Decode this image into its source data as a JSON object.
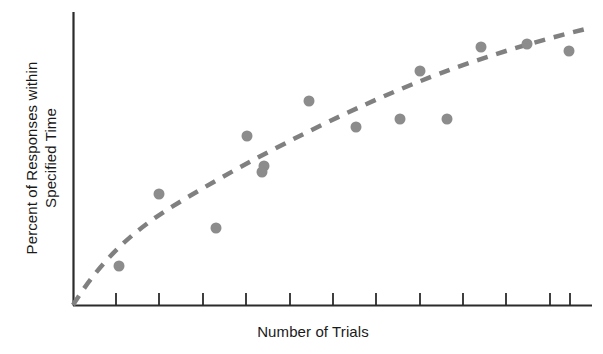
{
  "figure": {
    "background_color": "#ffffff",
    "axis_color": "#2b2b2b",
    "marker_color": "#8c8c8c",
    "trend_color": "#808080"
  },
  "axes": {
    "y_title_line1": "Percent of Responses within",
    "y_title_line2": "Specified Time",
    "x_title": "Number of Trials",
    "tick_count": 12
  },
  "chart_data": {
    "type": "scatter",
    "title": "",
    "subtitle": "",
    "xlabel": "Number of Trials",
    "ylabel": "Percent of Responses within Specified Time",
    "grid": false,
    "legend": "none",
    "xlim": [
      0,
      12
    ],
    "ylim": [
      0,
      100
    ],
    "x_tick_labels": [],
    "y_tick_labels": [],
    "x_tick_values": [
      1,
      2,
      3,
      4,
      5,
      6,
      7,
      8,
      9,
      10,
      11,
      12
    ],
    "annotations": [],
    "series": [
      {
        "name": "Observed responses",
        "type": "scatter",
        "marker": "circle",
        "marker_radius_px": 5.5,
        "color": "#8c8c8c",
        "x": [
          1.05,
          2.0,
          2.9,
          3.3,
          4.0,
          4.4,
          5.4,
          6.5,
          7.5,
          8.0,
          8.6,
          9.4,
          10.5,
          11.5
        ],
        "y": [
          13.5,
          38.0,
          26.5,
          57.5,
          52.0,
          69.5,
          63.0,
          61.0,
          80.0,
          61.0,
          88.0,
          89.5,
          90.5,
          88.0
        ],
        "points_px": [
          [
            119,
            266
          ],
          [
            159,
            194
          ],
          [
            216,
            228
          ],
          [
            247,
            136
          ],
          [
            264,
            166
          ],
          [
            309,
            101
          ],
          [
            356,
            127
          ],
          [
            400,
            119
          ],
          [
            420,
            71
          ],
          [
            447,
            119
          ],
          [
            481,
            47
          ],
          [
            527,
            44
          ],
          [
            569,
            51
          ],
          [
            262,
            172
          ]
        ]
      },
      {
        "name": "Fitted learning curve",
        "type": "line",
        "style": "dashed",
        "color": "#808080",
        "width_px": 4.5,
        "dash_pattern": "11 9",
        "description": "Negatively accelerated logarithmic curve rising from the origin and flattening at the right",
        "x": [
          0,
          1,
          2,
          3,
          4,
          5,
          6,
          7,
          8,
          9,
          10,
          11,
          12
        ],
        "y": [
          0,
          22,
          38,
          50,
          59,
          67,
          73,
          78,
          83,
          87,
          90,
          93,
          96
        ]
      }
    ]
  }
}
